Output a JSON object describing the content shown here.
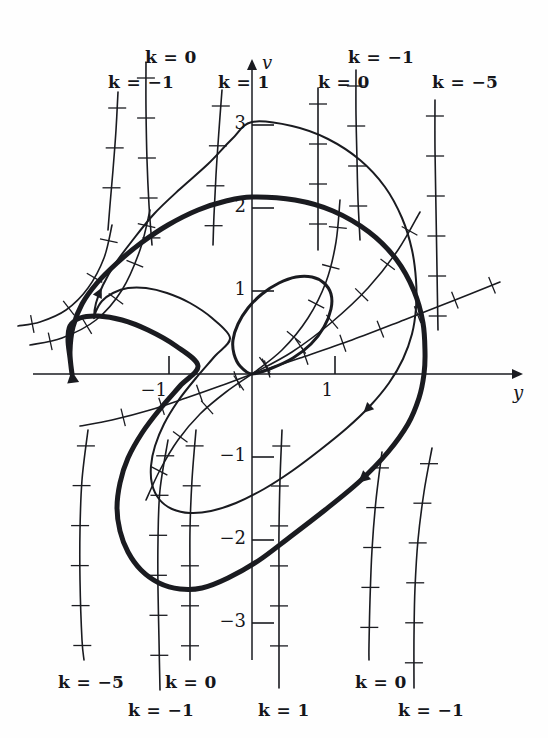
{
  "figure": {
    "kind": "phase-plane-isocline-diagram",
    "background": "#fefefe",
    "ink": "#1a1b20",
    "width": 548,
    "height": 738
  },
  "axes": {
    "x_axis_label": "y",
    "y_axis_label": "v",
    "origin_px": [
      252,
      374
    ],
    "unit_px": 83,
    "x_ticks": [
      {
        "label": "−1",
        "value": -1
      },
      {
        "label": "1",
        "value": 1
      }
    ],
    "y_ticks": [
      {
        "label": "3",
        "value": 3
      },
      {
        "label": "2",
        "value": 2
      },
      {
        "label": "1",
        "value": 1
      },
      {
        "label": "−1",
        "value": -1
      },
      {
        "label": "−2",
        "value": -2
      },
      {
        "label": "−3",
        "value": -3
      }
    ]
  },
  "isocline_labels": {
    "top": [
      {
        "id": "top-k0-left",
        "text": "k = 0",
        "x": 145,
        "y": 47
      },
      {
        "id": "top-km1-left",
        "text": "k = −1",
        "x": 108,
        "y": 72
      },
      {
        "id": "top-k1",
        "text": "k = 1",
        "x": 218,
        "y": 72
      },
      {
        "id": "top-km1-right",
        "text": "k = −1",
        "x": 348,
        "y": 47
      },
      {
        "id": "top-k0-right",
        "text": "k = 0",
        "x": 318,
        "y": 72
      },
      {
        "id": "top-km5",
        "text": "k = −5",
        "x": 432,
        "y": 72
      }
    ],
    "bottom": [
      {
        "id": "bot-km5",
        "text": "k = −5",
        "x": 58,
        "y": 672
      },
      {
        "id": "bot-k0-l",
        "text": "k = 0",
        "x": 165,
        "y": 672
      },
      {
        "id": "bot-km1-l",
        "text": "k = −1",
        "x": 128,
        "y": 700
      },
      {
        "id": "bot-k1",
        "text": "k = 1",
        "x": 258,
        "y": 700
      },
      {
        "id": "bot-k0-r",
        "text": "k = 0",
        "x": 355,
        "y": 672
      },
      {
        "id": "bot-km1-r",
        "text": "k = −1",
        "x": 398,
        "y": 700
      }
    ]
  },
  "chart_data": {
    "type": "line",
    "title": "",
    "xlabel": "y",
    "ylabel": "v",
    "xlim": [
      -2.65,
      3.2
    ],
    "ylim": [
      -4.35,
      3.8
    ],
    "grid": false,
    "legend": "inline isocline labels k = 1, 0, −1, −5",
    "annotations": [
      "thick closed curve = stable limit cycle",
      "thin closed curve = neighbouring trajectory spiralling onto the limit cycle",
      "small loop at the origin = inner trajectory",
      "short hatch marks on the isoclines indicate the slope field direction k = dv/dy"
    ],
    "series": [
      {
        "name": "limit-cycle-thick",
        "role": "limit cycle",
        "closed": true,
        "stroke_width": 5,
        "points_px": [
          [
            252,
            197
          ],
          [
            295,
            200
          ],
          [
            333,
            211
          ],
          [
            369,
            232
          ],
          [
            396,
            259
          ],
          [
            414,
            291
          ],
          [
            423,
            323
          ],
          [
            425,
            352
          ],
          [
            424,
            374
          ],
          [
            419,
            398
          ],
          [
            408,
            424
          ],
          [
            388,
            452
          ],
          [
            360,
            481
          ],
          [
            325,
            510
          ],
          [
            290,
            537
          ],
          [
            258,
            561
          ],
          [
            228,
            578
          ],
          [
            202,
            588
          ],
          [
            180,
            589
          ],
          [
            159,
            583
          ],
          [
            141,
            570
          ],
          [
            128,
            552
          ],
          [
            120,
            531
          ],
          [
            117,
            508
          ],
          [
            120,
            483
          ],
          [
            128,
            458
          ],
          [
            142,
            433
          ],
          [
            160,
            409
          ],
          [
            180,
            386
          ],
          [
            198,
            366
          ],
          [
            176,
            346
          ],
          [
            148,
            330
          ],
          [
            122,
            320
          ],
          [
            98,
            316
          ],
          [
            80,
            318
          ],
          [
            70,
            326
          ],
          [
            68,
            340
          ],
          [
            70,
            358
          ],
          [
            72,
            374
          ],
          [
            70,
            352
          ],
          [
            73,
            327
          ],
          [
            82,
            304
          ],
          [
            97,
            283
          ],
          [
            117,
            263
          ],
          [
            141,
            243
          ],
          [
            168,
            225
          ],
          [
            198,
            210
          ],
          [
            226,
            201
          ],
          [
            252,
            197
          ]
        ]
      },
      {
        "name": "inner-orbit-thin",
        "role": "nearby trajectory",
        "closed": true,
        "stroke_width": 2,
        "points_px": [
          [
            252,
            122
          ],
          [
            292,
            126
          ],
          [
            328,
            139
          ],
          [
            360,
            160
          ],
          [
            385,
            187
          ],
          [
            402,
            218
          ],
          [
            412,
            250
          ],
          [
            416,
            280
          ],
          [
            416,
            308
          ],
          [
            412,
            334
          ],
          [
            403,
            359
          ],
          [
            389,
            383
          ],
          [
            370,
            406
          ],
          [
            347,
            428
          ],
          [
            320,
            450
          ],
          [
            292,
            471
          ],
          [
            264,
            489
          ],
          [
            236,
            503
          ],
          [
            211,
            511
          ],
          [
            190,
            513
          ],
          [
            172,
            509
          ],
          [
            159,
            499
          ],
          [
            152,
            484
          ],
          [
            151,
            466
          ],
          [
            155,
            446
          ],
          [
            164,
            424
          ],
          [
            178,
            401
          ],
          [
            196,
            378
          ],
          [
            215,
            356
          ],
          [
            230,
            338
          ],
          [
            212,
            318
          ],
          [
            190,
            303
          ],
          [
            167,
            293
          ],
          [
            146,
            288
          ],
          [
            128,
            288
          ],
          [
            113,
            293
          ],
          [
            102,
            301
          ],
          [
            96,
            311
          ],
          [
            94,
            318
          ],
          [
            96,
            303
          ],
          [
            103,
            285
          ],
          [
            115,
            264
          ],
          [
            132,
            241
          ],
          [
            154,
            214
          ],
          [
            180,
            189
          ],
          [
            208,
            164
          ],
          [
            232,
            139
          ],
          [
            252,
            122
          ]
        ]
      },
      {
        "name": "origin-small-loop",
        "role": "inner trajectory loop",
        "closed": true,
        "stroke_width": 3,
        "points_px": [
          [
            252,
            374
          ],
          [
            272,
            368
          ],
          [
            293,
            358
          ],
          [
            311,
            344
          ],
          [
            324,
            327
          ],
          [
            331,
            309
          ],
          [
            331,
            294
          ],
          [
            324,
            283
          ],
          [
            312,
            277
          ],
          [
            296,
            277
          ],
          [
            279,
            283
          ],
          [
            262,
            294
          ],
          [
            248,
            308
          ],
          [
            238,
            324
          ],
          [
            233,
            340
          ],
          [
            234,
            354
          ],
          [
            240,
            366
          ],
          [
            252,
            374
          ]
        ]
      },
      {
        "name": "isocline-top-k0-left",
        "role": "isocline k = 0",
        "closed": false,
        "stroke_width": 1.6,
        "points_px": [
          [
            146,
            62
          ],
          [
            146,
            110
          ],
          [
            147,
            160
          ],
          [
            149,
            205
          ],
          [
            152,
            245
          ]
        ]
      },
      {
        "name": "isocline-top-km1-left",
        "role": "isocline k = -1",
        "closed": false,
        "stroke_width": 1.6,
        "points_px": [
          [
            118,
            92
          ],
          [
            116,
            130
          ],
          [
            113,
            170
          ],
          [
            110,
            205
          ],
          [
            108,
            230
          ]
        ]
      },
      {
        "name": "isocline-top-k1",
        "role": "isocline k = 1",
        "closed": false,
        "stroke_width": 1.6,
        "points_px": [
          [
            222,
            90
          ],
          [
            219,
            130
          ],
          [
            216,
            175
          ],
          [
            214,
            215
          ],
          [
            213,
            245
          ]
        ]
      },
      {
        "name": "isocline-top-km1-right",
        "role": "isocline k = -1",
        "closed": false,
        "stroke_width": 1.6,
        "points_px": [
          [
            356,
            70
          ],
          [
            356,
            115
          ],
          [
            357,
            160
          ],
          [
            358,
            200
          ],
          [
            360,
            240
          ]
        ]
      },
      {
        "name": "isocline-top-k0-right",
        "role": "isocline k = 0",
        "closed": false,
        "stroke_width": 1.6,
        "points_px": [
          [
            318,
            88
          ],
          [
            318,
            130
          ],
          [
            318,
            175
          ],
          [
            318,
            215
          ],
          [
            318,
            250
          ]
        ]
      },
      {
        "name": "isocline-top-km5",
        "role": "isocline k = -5",
        "closed": false,
        "stroke_width": 1.6,
        "points_px": [
          [
            435,
            100
          ],
          [
            435,
            150
          ],
          [
            436,
            210
          ],
          [
            437,
            270
          ],
          [
            438,
            330
          ]
        ]
      },
      {
        "name": "isocline-left-sweep-a",
        "role": "isocline branch",
        "closed": false,
        "stroke_width": 1.6,
        "points_px": [
          [
            150,
            210
          ],
          [
            140,
            250
          ],
          [
            122,
            290
          ],
          [
            96,
            320
          ],
          [
            62,
            338
          ],
          [
            30,
            345
          ]
        ]
      },
      {
        "name": "isocline-left-sweep-b",
        "role": "isocline branch",
        "closed": false,
        "stroke_width": 1.6,
        "points_px": [
          [
            112,
            225
          ],
          [
            104,
            258
          ],
          [
            88,
            288
          ],
          [
            66,
            310
          ],
          [
            40,
            322
          ],
          [
            18,
            326
          ]
        ]
      },
      {
        "name": "isocline-center-fan",
        "role": "isocline through origin",
        "closed": false,
        "stroke_width": 1.6,
        "points_px": [
          [
            252,
            374
          ],
          [
            300,
            358
          ],
          [
            352,
            340
          ],
          [
            404,
            320
          ],
          [
            455,
            300
          ],
          [
            500,
            282
          ]
        ]
      },
      {
        "name": "isocline-center-fan-2",
        "role": "isocline through origin",
        "closed": false,
        "stroke_width": 1.6,
        "points_px": [
          [
            252,
            374
          ],
          [
            292,
            352
          ],
          [
            332,
            322
          ],
          [
            368,
            288
          ],
          [
            398,
            250
          ],
          [
            420,
            212
          ]
        ]
      },
      {
        "name": "isocline-center-fan-3",
        "role": "isocline through origin",
        "closed": false,
        "stroke_width": 1.6,
        "points_px": [
          [
            252,
            374
          ],
          [
            282,
            350
          ],
          [
            308,
            318
          ],
          [
            326,
            282
          ],
          [
            336,
            242
          ],
          [
            340,
            200
          ]
        ]
      },
      {
        "name": "isocline-center-fan-4",
        "role": "isocline through origin",
        "closed": false,
        "stroke_width": 1.6,
        "points_px": [
          [
            252,
            374
          ],
          [
            226,
            392
          ],
          [
            200,
            414
          ],
          [
            178,
            440
          ],
          [
            160,
            470
          ],
          [
            146,
            500
          ]
        ]
      },
      {
        "name": "isocline-center-fan-5",
        "role": "isocline through origin",
        "closed": false,
        "stroke_width": 1.6,
        "points_px": [
          [
            252,
            374
          ],
          [
            220,
            386
          ],
          [
            186,
            398
          ],
          [
            150,
            410
          ],
          [
            112,
            420
          ],
          [
            80,
            426
          ]
        ]
      },
      {
        "name": "isocline-lower-left-a",
        "role": "isocline k = -5",
        "closed": false,
        "stroke_width": 1.6,
        "points_px": [
          [
            88,
            430
          ],
          [
            82,
            480
          ],
          [
            80,
            530
          ],
          [
            80,
            580
          ],
          [
            82,
            640
          ],
          [
            84,
            660
          ]
        ]
      },
      {
        "name": "isocline-lower-left-b",
        "role": "isocline k = -1",
        "closed": false,
        "stroke_width": 1.6,
        "points_px": [
          [
            168,
            440
          ],
          [
            160,
            490
          ],
          [
            158,
            540
          ],
          [
            158,
            590
          ],
          [
            159,
            640
          ],
          [
            160,
            690
          ]
        ]
      },
      {
        "name": "isocline-lower-mid",
        "role": "isocline k = 0",
        "closed": false,
        "stroke_width": 1.6,
        "points_px": [
          [
            196,
            430
          ],
          [
            192,
            480
          ],
          [
            190,
            530
          ],
          [
            190,
            580
          ],
          [
            190,
            630
          ],
          [
            190,
            660
          ]
        ]
      },
      {
        "name": "isocline-lower-k1",
        "role": "isocline k = 1",
        "closed": false,
        "stroke_width": 1.6,
        "points_px": [
          [
            282,
            430
          ],
          [
            280,
            480
          ],
          [
            279,
            530
          ],
          [
            279,
            580
          ],
          [
            279,
            630
          ],
          [
            279,
            688
          ]
        ]
      },
      {
        "name": "isocline-lower-k0-right",
        "role": "isocline k = 0",
        "closed": false,
        "stroke_width": 1.6,
        "points_px": [
          [
            382,
            452
          ],
          [
            376,
            500
          ],
          [
            372,
            550
          ],
          [
            370,
            600
          ],
          [
            369,
            645
          ],
          [
            369,
            660
          ]
        ]
      },
      {
        "name": "isocline-lower-km1-right",
        "role": "isocline k = -1",
        "closed": false,
        "stroke_width": 1.6,
        "points_px": [
          [
            432,
            448
          ],
          [
            424,
            492
          ],
          [
            418,
            540
          ],
          [
            415,
            588
          ],
          [
            414,
            636
          ],
          [
            414,
            688
          ]
        ]
      }
    ]
  }
}
